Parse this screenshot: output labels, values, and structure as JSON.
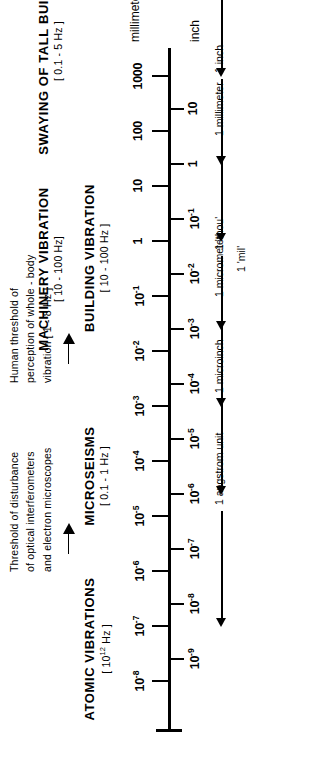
{
  "figure": {
    "orientation": "rotated-90",
    "line_color": "#000000",
    "background": "#ffffff"
  },
  "units": {
    "top_caption": "millimeter",
    "bottom_caption": "inch"
  },
  "chart_data": {
    "type": "scatter",
    "xlabel": "millimeter",
    "ylabel": "inch",
    "grid": false,
    "legend": "none",
    "axis_scale": "log10",
    "xlim": [
      -8,
      3
    ],
    "mm_scale": {
      "label": "millimeter",
      "tick_exponents": [
        3,
        2,
        1,
        0,
        -1,
        -2,
        -3,
        -4,
        -5,
        -6,
        -7,
        -8
      ],
      "tick_labels": [
        "1000",
        "100",
        "10",
        "1",
        "10⁻¹",
        "10⁻²",
        "10⁻³",
        "10⁻⁴",
        "10⁻⁵",
        "10⁻⁶",
        "10⁻⁷",
        "10⁻⁸"
      ],
      "tick_label_parts": [
        {
          "base": "1000",
          "exp": ""
        },
        {
          "base": "100",
          "exp": ""
        },
        {
          "base": "10",
          "exp": ""
        },
        {
          "base": "1",
          "exp": ""
        },
        {
          "base": "10",
          "exp": "-1"
        },
        {
          "base": "10",
          "exp": "-2"
        },
        {
          "base": "10",
          "exp": "-3"
        },
        {
          "base": "10",
          "exp": "-4"
        },
        {
          "base": "10",
          "exp": "-5"
        },
        {
          "base": "10",
          "exp": "-6"
        },
        {
          "base": "10",
          "exp": "-7"
        },
        {
          "base": "10",
          "exp": "-8"
        }
      ]
    },
    "inch_scale": {
      "label": "inch",
      "tick_exponents": [
        1,
        0,
        -1,
        -2,
        -3,
        -4,
        -5,
        -6,
        -7,
        -8,
        -9
      ],
      "tick_labels": [
        "10",
        "1",
        "10⁻¹",
        "10⁻²",
        "10⁻³",
        "10⁻⁴",
        "10⁻⁵",
        "10⁻⁶",
        "10⁻⁷",
        "10⁻⁸",
        "10⁻⁹"
      ],
      "tick_label_parts": [
        {
          "base": "10",
          "exp": ""
        },
        {
          "base": "1",
          "exp": ""
        },
        {
          "base": "10",
          "exp": "-1"
        },
        {
          "base": "10",
          "exp": "-2"
        },
        {
          "base": "10",
          "exp": "-3"
        },
        {
          "base": "10",
          "exp": "-4"
        },
        {
          "base": "10",
          "exp": "-5"
        },
        {
          "base": "10",
          "exp": "-6"
        },
        {
          "base": "10",
          "exp": "-7"
        },
        {
          "base": "10",
          "exp": "-8"
        },
        {
          "base": "10",
          "exp": "-9"
        }
      ]
    },
    "reference_markers": [
      {
        "label": "1 meter",
        "mm_exponent": 3
      },
      {
        "label": "1 inch",
        "mm_exponent": 1.4
      },
      {
        "label": "1 millimeter",
        "mm_exponent": 0
      },
      {
        "label": "1 'thou'",
        "mm_exponent": -1.6
      },
      {
        "label": "1 'mil'",
        "mm_exponent": -1.6
      },
      {
        "label": "1 micrometer",
        "mm_exponent": -3
      },
      {
        "label": "1 microinch",
        "mm_exponent": -4.6
      },
      {
        "label": "1 angstrom unit",
        "mm_exponent": -7
      }
    ],
    "categories": [
      {
        "name": "SWAYING OF TALL BUILDINGS",
        "freq_base": "[ 0.1 - 5 ",
        "freq_exp": "",
        "freq_tail": "Hz ]"
      },
      {
        "name": "BUILDING VIBRATION",
        "freq_base": "[ 10 - 100 ",
        "freq_exp": "",
        "freq_tail": "Hz ]"
      },
      {
        "name": "MACHINERY VIBRATION",
        "freq_base": "[ 10 - 100 ",
        "freq_exp": "",
        "freq_tail": "Hz]"
      },
      {
        "name": "MICROSEISMS",
        "freq_base": "[ 0.1 - 1 ",
        "freq_exp": "",
        "freq_tail": "Hz ]"
      },
      {
        "name": "ATOMIC VIBRATIONS",
        "freq_base": "[ 10",
        "freq_exp": "12",
        "freq_tail": " Hz ]"
      }
    ],
    "notes": [
      {
        "text": "Human  threshold  of\nperception  of  whole - body\nvibration  [ 1 - 8  Hz ]"
      },
      {
        "text": "Threshold  of  disturbance\nof  optical  interferometers\nand  electron  microscopes"
      }
    ]
  },
  "scale_labels": {
    "mm": [
      {
        "base": "1000",
        "exp": ""
      },
      {
        "base": "100",
        "exp": ""
      },
      {
        "base": "10",
        "exp": ""
      },
      {
        "base": "1",
        "exp": ""
      },
      {
        "base": "10",
        "exp": "-1"
      },
      {
        "base": "10",
        "exp": "-2"
      },
      {
        "base": "10",
        "exp": "-3"
      },
      {
        "base": "10",
        "exp": "-4"
      },
      {
        "base": "10",
        "exp": "-5"
      },
      {
        "base": "10",
        "exp": "-6"
      },
      {
        "base": "10",
        "exp": "-7"
      },
      {
        "base": "10",
        "exp": "-8"
      }
    ],
    "inch": [
      {
        "base": "10",
        "exp": ""
      },
      {
        "base": "1",
        "exp": ""
      },
      {
        "base": "10",
        "exp": "-1"
      },
      {
        "base": "10",
        "exp": "-2"
      },
      {
        "base": "10",
        "exp": "-3"
      },
      {
        "base": "10",
        "exp": "-4"
      },
      {
        "base": "10",
        "exp": "-5"
      },
      {
        "base": "10",
        "exp": "-6"
      },
      {
        "base": "10",
        "exp": "-7"
      },
      {
        "base": "10",
        "exp": "-8"
      },
      {
        "base": "10",
        "exp": "-9"
      }
    ]
  },
  "references": {
    "meter": "1 meter",
    "inch": "1 inch",
    "millimeter": "1 millimeter",
    "thou": "1 'thou'",
    "mil": "1 'mil'",
    "micrometer": "1 micrometer",
    "microinch": "1 microinch",
    "angstrom": "1 angstrom unit"
  },
  "sections": {
    "swaying": {
      "name": "SWAYING OF TALL BUILDINGS",
      "freq": "[ 0.1 - 5  Hz ]"
    },
    "building": {
      "name": "BUILDING VIBRATION",
      "freq": "[ 10 - 100 Hz ]"
    },
    "machinery": {
      "name": "MACHINERY VIBRATION",
      "freq": "[ 10 - 100 Hz]"
    },
    "microseisms": {
      "name": "MICROSEISMS",
      "freq": "[ 0.1 - 1 Hz ]"
    },
    "atomic": {
      "name": "ATOMIC VIBRATIONS",
      "freq_pre": "[ 10",
      "freq_exp": "12",
      "freq_post": " Hz ]"
    }
  },
  "notes": {
    "human": "Human  threshold  of\nperception  of  whole - body\nvibration  [ 1 - 8  Hz ]",
    "optical": "Threshold  of  disturbance\nof  optical  interferometers\nand  electron  microscopes"
  }
}
